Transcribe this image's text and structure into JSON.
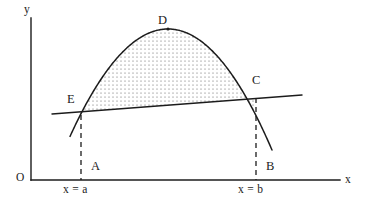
{
  "figure": {
    "background_color": "#ffffff",
    "stroke_color": "#1c1c1c",
    "shade_color": "#4a4a4a",
    "width": 370,
    "height": 214
  },
  "axes": {
    "origin_label": "O",
    "x_axis_label": "x",
    "y_axis_label": "y",
    "x_axis": {
      "x_start": 31,
      "x_end": 340,
      "y": 180
    },
    "y_axis": {
      "x": 31,
      "y_start": 18,
      "y_end": 180
    }
  },
  "points": [
    {
      "id": "D",
      "label": "D",
      "description": "vertex of parabola",
      "x": 168,
      "y": 29,
      "label_x": 158,
      "label_y": 14,
      "marker": true
    },
    {
      "id": "C",
      "label": "C",
      "description": "right intersection of chord and parabola",
      "x": 256,
      "y": 98,
      "label_x": 252,
      "label_y": 74,
      "marker": false
    },
    {
      "id": "E",
      "label": "E",
      "description": "left intersection of chord and parabola",
      "x": 80,
      "y": 113,
      "label_x": 67,
      "label_y": 93,
      "marker": false
    },
    {
      "id": "A",
      "label": "A",
      "description": "foot of perpendicular at x = a",
      "x": 81,
      "y": 180,
      "label_x": 91,
      "label_y": 160,
      "marker": false
    },
    {
      "id": "B",
      "label": "B",
      "description": "foot of perpendicular at x = b",
      "x": 256,
      "y": 180,
      "label_x": 266,
      "label_y": 160,
      "marker": false
    }
  ],
  "bounds": [
    {
      "id": "lower",
      "label": "x = a",
      "x": 81,
      "label_x": 63,
      "label_y": 184
    },
    {
      "id": "upper",
      "label": "x = b",
      "x": 256,
      "label_x": 238,
      "label_y": 184
    }
  ],
  "curve": {
    "type": "parabola",
    "description": "downward opening parabola through E, D, C",
    "vertex": {
      "x": 168,
      "y": 29
    },
    "left_end": {
      "x": 70,
      "y": 152
    },
    "right_end": {
      "x": 272,
      "y": 150
    },
    "samples": [
      {
        "x": 70,
        "y": 152
      },
      {
        "x": 80,
        "y": 113
      },
      {
        "x": 95,
        "y": 81
      },
      {
        "x": 115,
        "y": 56
      },
      {
        "x": 140,
        "y": 38
      },
      {
        "x": 168,
        "y": 29
      },
      {
        "x": 196,
        "y": 38
      },
      {
        "x": 222,
        "y": 58
      },
      {
        "x": 243,
        "y": 81
      },
      {
        "x": 256,
        "y": 98
      },
      {
        "x": 272,
        "y": 150
      }
    ]
  },
  "chord": {
    "type": "line",
    "description": "secant line EC extended past both intersections",
    "start": {
      "x": 52,
      "y": 114
    },
    "end": {
      "x": 302,
      "y": 95
    }
  },
  "dashed_lines": [
    {
      "id": "dash-a",
      "x": 81,
      "y_top": 115,
      "y_bottom": 180
    },
    {
      "id": "dash-b",
      "x": 256,
      "y_top": 98,
      "y_bottom": 180
    }
  ],
  "shaded_region": {
    "description": "stippled area between chord EC and parabola arc EDC",
    "pattern": "dot-stipple",
    "dot_spacing": 4,
    "dot_radius": 0.55
  }
}
